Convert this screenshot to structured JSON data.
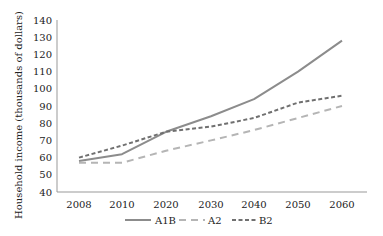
{
  "chart_data": {
    "type": "line",
    "title": "",
    "xlabel": "",
    "ylabel": "Household income (thousands of dollars)",
    "categories": [
      "2008",
      "2010",
      "2020",
      "2030",
      "2040",
      "2050",
      "2060"
    ],
    "ylim": [
      40,
      140
    ],
    "yticks": [
      40,
      50,
      60,
      70,
      80,
      90,
      100,
      110,
      120,
      130,
      140
    ],
    "grid": false,
    "legend_position": "bottom",
    "series": [
      {
        "name": "A1B",
        "style": "solid",
        "color": "#8c8c8c",
        "values": [
          58,
          62,
          75,
          84,
          94,
          110,
          128
        ]
      },
      {
        "name": "A2",
        "style": "long-dash",
        "color": "#b5b5b5",
        "values": [
          57,
          57,
          64,
          70,
          76,
          83,
          90
        ]
      },
      {
        "name": "B2",
        "style": "short-dash",
        "color": "#707070",
        "values": [
          60,
          67,
          75,
          78,
          83,
          92,
          96
        ]
      }
    ]
  }
}
